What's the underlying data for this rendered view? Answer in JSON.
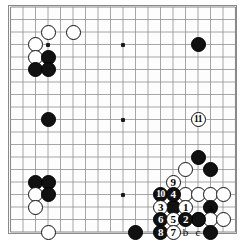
{
  "figure": {
    "type": "go-board-diagram",
    "board_size": 19,
    "visible_grid": {
      "left_px": 10.5,
      "top_px": 7.0,
      "spacing_px": 12.5,
      "cols": 19,
      "rows": 19
    },
    "colors": {
      "black_stone": "#111111",
      "white_stone": "#ffffff",
      "stone_outline": "#101010",
      "grid_line": "#8a8a8a",
      "board_background": "#fdfdfd",
      "page_background": "#ffffff"
    },
    "stone_diameter_px": 15
  },
  "hoshi_points": [
    {
      "col": 3,
      "row": 3
    },
    {
      "col": 9,
      "row": 3
    },
    {
      "col": 15,
      "row": 3
    },
    {
      "col": 3,
      "row": 9
    },
    {
      "col": 9,
      "row": 9
    },
    {
      "col": 15,
      "row": 9
    },
    {
      "col": 3,
      "row": 15
    },
    {
      "col": 9,
      "row": 15
    },
    {
      "col": 15,
      "row": 15
    }
  ],
  "stones": [
    {
      "id": "w-top-1",
      "color": "white",
      "col": 3,
      "row": 2,
      "label": ""
    },
    {
      "id": "w-top-2",
      "color": "white",
      "col": 5,
      "row": 2,
      "label": ""
    },
    {
      "id": "w-ul-1",
      "color": "white",
      "col": 2,
      "row": 3,
      "label": ""
    },
    {
      "id": "w-ul-2",
      "color": "white",
      "col": 2,
      "row": 4,
      "label": ""
    },
    {
      "id": "b-ul-1",
      "color": "black",
      "col": 3,
      "row": 4,
      "label": ""
    },
    {
      "id": "b-ul-2",
      "color": "black",
      "col": 2,
      "row": 5,
      "label": ""
    },
    {
      "id": "b-ul-3",
      "color": "black",
      "col": 3,
      "row": 5,
      "label": ""
    },
    {
      "id": "b-tr-1",
      "color": "black",
      "col": 15,
      "row": 3,
      "label": ""
    },
    {
      "id": "b-left-1",
      "color": "black",
      "col": 3,
      "row": 9,
      "label": ""
    },
    {
      "id": "b-r-1",
      "color": "black",
      "col": 15,
      "row": 12,
      "label": ""
    },
    {
      "id": "w-r-1",
      "color": "white",
      "col": 14,
      "row": 13,
      "label": ""
    },
    {
      "id": "b-r-2",
      "color": "black",
      "col": 16,
      "row": 13,
      "label": ""
    },
    {
      "id": "b-ll-1",
      "color": "black",
      "col": 2,
      "row": 14,
      "label": ""
    },
    {
      "id": "b-ll-2",
      "color": "black",
      "col": 3,
      "row": 14,
      "label": ""
    },
    {
      "id": "w-ll-1",
      "color": "white",
      "col": 2,
      "row": 15,
      "label": ""
    },
    {
      "id": "b-ll-3",
      "color": "black",
      "col": 3,
      "row": 15,
      "label": ""
    },
    {
      "id": "w-ll-2",
      "color": "white",
      "col": 2,
      "row": 16,
      "label": ""
    },
    {
      "id": "w-ll-3",
      "color": "white",
      "col": 3,
      "row": 18,
      "label": ""
    },
    {
      "id": "w-br-a",
      "color": "white",
      "col": 14,
      "row": 15,
      "label": ""
    },
    {
      "id": "w-br-b",
      "color": "white",
      "col": 15,
      "row": 15,
      "label": ""
    },
    {
      "id": "w-br-c",
      "color": "white",
      "col": 16,
      "row": 15,
      "label": ""
    },
    {
      "id": "w-br-d",
      "color": "white",
      "col": 17,
      "row": 15,
      "label": ""
    },
    {
      "id": "b-br-1",
      "color": "black",
      "col": 16,
      "row": 16,
      "label": ""
    },
    {
      "id": "w-br-e",
      "color": "white",
      "col": 15,
      "row": 17,
      "label": ""
    },
    {
      "id": "w-br-f",
      "color": "white",
      "col": 16,
      "row": 17,
      "label": ""
    },
    {
      "id": "w-br-g",
      "color": "white",
      "col": 17,
      "row": 17,
      "label": ""
    },
    {
      "id": "b-br-2",
      "color": "black",
      "col": 15,
      "row": 17,
      "label": ""
    },
    {
      "id": "b-bot-1",
      "color": "black",
      "col": 10,
      "row": 18,
      "label": ""
    },
    {
      "id": "b-br-3",
      "color": "black",
      "col": 16,
      "row": 18,
      "label": ""
    }
  ],
  "numbered_moves": [
    {
      "n": "11",
      "color": "white",
      "col": 15,
      "row": 9,
      "name": "move-11-white"
    },
    {
      "n": "9",
      "color": "white",
      "col": 13,
      "row": 14,
      "name": "move-9-white"
    },
    {
      "n": "10",
      "color": "black",
      "col": 12,
      "row": 15,
      "name": "move-10-black"
    },
    {
      "n": "4",
      "color": "black",
      "col": 13,
      "row": 15,
      "name": "move-4-black"
    },
    {
      "n": "3",
      "color": "white",
      "col": 12,
      "row": 16,
      "name": "move-3-white"
    },
    {
      "n": "1",
      "color": "white",
      "col": 14,
      "row": 16,
      "name": "move-1-white"
    },
    {
      "n": "6",
      "color": "black",
      "col": 12,
      "row": 17,
      "name": "move-6-black"
    },
    {
      "n": "5",
      "color": "white",
      "col": 13,
      "row": 17,
      "name": "move-5-white"
    },
    {
      "n": "2",
      "color": "black",
      "col": 14,
      "row": 17,
      "name": "move-2-black"
    },
    {
      "n": "8",
      "color": "black",
      "col": 12,
      "row": 18,
      "name": "move-8-black"
    },
    {
      "n": "7",
      "color": "white",
      "col": 13,
      "row": 18,
      "name": "move-7-white"
    }
  ],
  "black_played_points": [
    {
      "col": 13,
      "row": 16,
      "name": "black-stone-under-3"
    }
  ],
  "letter_markers": [
    {
      "letter": "a",
      "col": 16,
      "row": 16,
      "name": "marker-a"
    },
    {
      "letter": "b",
      "col": 14,
      "row": 18,
      "name": "marker-b"
    },
    {
      "letter": "c",
      "col": 15,
      "row": 18,
      "name": "marker-c"
    }
  ]
}
